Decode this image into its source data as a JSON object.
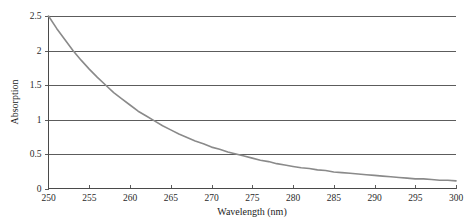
{
  "chart_data": {
    "type": "line",
    "title": "",
    "xlabel": "Wavelength (nm)",
    "ylabel": "Absorption",
    "xlim": [
      250,
      300
    ],
    "ylim": [
      0,
      2.5
    ],
    "grid": true,
    "grid_axis": "y",
    "legend": false,
    "legend_position": "none",
    "series_color": "#8a8a8a",
    "x_ticks": [
      250,
      255,
      260,
      265,
      270,
      275,
      280,
      285,
      290,
      295,
      300
    ],
    "x_tick_labels": [
      "250",
      "255",
      "260",
      "265",
      "270",
      "275",
      "280",
      "285",
      "290",
      "295",
      "300"
    ],
    "y_ticks": [
      0,
      0.5,
      1,
      1.5,
      2,
      2.5
    ],
    "y_tick_labels": [
      "0",
      "0.5",
      "1",
      "1.5",
      "2",
      "2.5"
    ],
    "series": [
      {
        "name": "Absorption spectrum",
        "x": [
          250,
          251,
          252,
          253,
          254,
          255,
          256,
          257,
          258,
          259,
          260,
          261,
          262,
          263,
          264,
          265,
          266,
          267,
          268,
          269,
          270,
          271,
          272,
          273,
          274,
          275,
          276,
          277,
          278,
          279,
          280,
          281,
          282,
          283,
          284,
          285,
          286,
          287,
          288,
          289,
          290,
          291,
          292,
          293,
          294,
          295,
          296,
          297,
          298,
          299,
          300
        ],
        "y": [
          2.5,
          2.32,
          2.16,
          2.0,
          1.86,
          1.73,
          1.61,
          1.5,
          1.39,
          1.3,
          1.21,
          1.12,
          1.05,
          0.98,
          0.91,
          0.85,
          0.79,
          0.74,
          0.69,
          0.65,
          0.6,
          0.57,
          0.53,
          0.5,
          0.47,
          0.44,
          0.41,
          0.39,
          0.36,
          0.34,
          0.32,
          0.3,
          0.29,
          0.27,
          0.26,
          0.24,
          0.23,
          0.22,
          0.21,
          0.2,
          0.19,
          0.18,
          0.17,
          0.16,
          0.15,
          0.14,
          0.14,
          0.13,
          0.12,
          0.12,
          0.11
        ]
      }
    ]
  },
  "axes": {
    "x_title": "Wavelength (nm)",
    "y_title": "Absorption"
  }
}
